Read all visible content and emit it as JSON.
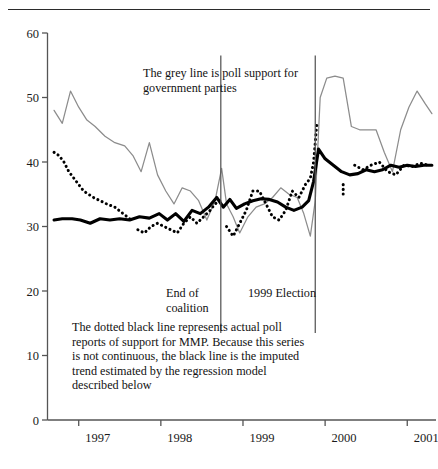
{
  "figure": {
    "clipped_header_text": "",
    "annotations": {
      "grey_line_note": "The grey line is poll support for\ngovernment parties",
      "end_of_coalition": "End of\ncoalition",
      "election_1999": "1999 Election",
      "dotted_line_note": "The dotted black line represents actual poll\nreports of support for MMP. Because this series\nis not continuous, the black line is the imputed\ntrend estimated by the regression model\ndescribed below"
    }
  },
  "chart_data": {
    "type": "line",
    "title": "",
    "xlabel": "",
    "ylabel": "",
    "xlim": [
      1996.62,
      2001.35
    ],
    "ylim": [
      0,
      60
    ],
    "grid": false,
    "legend": "annotations-inline",
    "y_ticks": [
      0,
      10,
      20,
      30,
      40,
      50,
      60
    ],
    "x_ticks": [
      1997,
      1998,
      1999,
      2000,
      2001
    ],
    "x_tick_labels": [
      "1997",
      "1998",
      "1999",
      "2000",
      "2001"
    ],
    "colors": {
      "grey_line": "#8c8c8c",
      "black_line": "#000000",
      "dotted_line": "#000000",
      "axis": "#555555",
      "event_line": "#555555"
    },
    "event_markers": [
      {
        "label": "End of coalition",
        "x": 1998.73
      },
      {
        "label": "1999 Election",
        "x": 1999.88
      }
    ],
    "series": [
      {
        "name": "Poll support for government parties",
        "style": "solid-grey",
        "x": [
          1996.7,
          1996.8,
          1996.9,
          1997.0,
          1997.1,
          1997.2,
          1997.32,
          1997.44,
          1997.56,
          1997.66,
          1997.76,
          1997.86,
          1997.96,
          1998.06,
          1998.16,
          1998.26,
          1998.36,
          1998.46,
          1998.56,
          1998.66,
          1998.74,
          1998.8,
          1998.88,
          1998.96,
          1999.06,
          1999.16,
          1999.26,
          1999.36,
          1999.46,
          1999.56,
          1999.66,
          1999.74,
          1999.82,
          1999.88,
          1999.94,
          2000.02,
          2000.12,
          2000.22,
          2000.32,
          2000.42,
          2000.52,
          2000.62,
          2000.72,
          2000.82,
          2000.92,
          2001.02,
          2001.12,
          2001.22,
          2001.3
        ],
        "y": [
          48.0,
          46.0,
          51.0,
          48.5,
          46.5,
          45.5,
          44.0,
          43.0,
          42.5,
          41.0,
          38.5,
          43.0,
          38.0,
          35.5,
          33.5,
          36.0,
          35.5,
          34.0,
          31.0,
          34.0,
          39.0,
          33.5,
          31.5,
          29.0,
          31.5,
          33.0,
          33.5,
          34.5,
          36.0,
          35.0,
          34.5,
          32.0,
          28.5,
          34.0,
          50.0,
          53.0,
          53.3,
          53.0,
          45.5,
          45.0,
          45.0,
          45.0,
          41.5,
          38.5,
          45.0,
          48.5,
          51.0,
          49.0,
          47.5
        ]
      },
      {
        "name": "Imputed MMP support trend (regression model)",
        "style": "solid-black-thick",
        "x": [
          1996.7,
          1996.8,
          1996.92,
          1997.02,
          1997.14,
          1997.26,
          1997.38,
          1997.5,
          1997.62,
          1997.74,
          1997.86,
          1997.98,
          1998.08,
          1998.18,
          1998.28,
          1998.38,
          1998.48,
          1998.58,
          1998.68,
          1998.76,
          1998.84,
          1998.92,
          1999.02,
          1999.12,
          1999.22,
          1999.32,
          1999.42,
          1999.52,
          1999.62,
          1999.72,
          1999.8,
          1999.86,
          1999.92,
          2000.0,
          2000.1,
          2000.2,
          2000.3,
          2000.4,
          2000.5,
          2000.6,
          2000.7,
          2000.8,
          2000.9,
          2001.0,
          2001.1,
          2001.2,
          2001.3
        ],
        "y": [
          31.0,
          31.2,
          31.2,
          31.0,
          30.5,
          31.2,
          31.0,
          31.2,
          31.0,
          31.5,
          31.3,
          32.0,
          31.0,
          32.0,
          30.8,
          32.5,
          32.0,
          33.0,
          34.5,
          33.0,
          34.2,
          32.8,
          33.5,
          34.0,
          34.3,
          34.2,
          33.8,
          33.0,
          32.5,
          33.0,
          34.0,
          37.0,
          42.0,
          40.5,
          39.5,
          38.5,
          38.0,
          38.2,
          38.8,
          38.5,
          38.8,
          39.5,
          39.2,
          39.5,
          39.3,
          39.5,
          39.5
        ]
      },
      {
        "name": "Actual poll reports of support for MMP",
        "style": "dotted-black",
        "segments": [
          {
            "x": [
              1996.7,
              1996.76,
              1996.82,
              1996.88,
              1996.94,
              1997.0,
              1997.06,
              1997.12,
              1997.18,
              1997.26,
              1997.34,
              1997.44,
              1997.54,
              1997.64
            ],
            "y": [
              41.5,
              41.0,
              40.0,
              38.5,
              37.5,
              36.5,
              35.5,
              35.0,
              34.5,
              34.0,
              33.5,
              33.0,
              32.0,
              31.0
            ]
          },
          {
            "x": [
              1997.72,
              1997.8,
              1997.88,
              1997.96,
              1998.04,
              1998.12,
              1998.2,
              1998.28,
              1998.36,
              1998.44,
              1998.52,
              1998.6,
              1998.66,
              1998.72
            ],
            "y": [
              29.5,
              29.0,
              30.0,
              30.5,
              30.0,
              29.5,
              29.0,
              30.5,
              31.5,
              30.5,
              31.5,
              32.5,
              33.5,
              34.0
            ]
          },
          {
            "x": [
              1998.8,
              1998.88,
              1998.96,
              1999.04,
              1999.12,
              1999.2,
              1999.28,
              1999.36,
              1999.44,
              1999.52,
              1999.6,
              1999.68,
              1999.76,
              1999.82,
              1999.86,
              1999.9
            ],
            "y": [
              30.0,
              28.5,
              30.5,
              32.5,
              35.5,
              35.5,
              33.5,
              31.5,
              31.0,
              32.5,
              35.5,
              34.5,
              36.5,
              37.5,
              40.0,
              46.0
            ]
          },
          {
            "x": [
              2000.22,
              2000.22
            ],
            "y": [
              36.5,
              34.5
            ]
          },
          {
            "x": [
              2000.36,
              2000.46,
              2000.56,
              2000.66,
              2000.76,
              2000.86,
              2000.96,
              2001.06,
              2001.16,
              2001.26
            ],
            "y": [
              39.5,
              38.8,
              39.5,
              40.0,
              38.5,
              38.0,
              39.5,
              39.3,
              39.8,
              39.5
            ]
          }
        ]
      }
    ]
  }
}
